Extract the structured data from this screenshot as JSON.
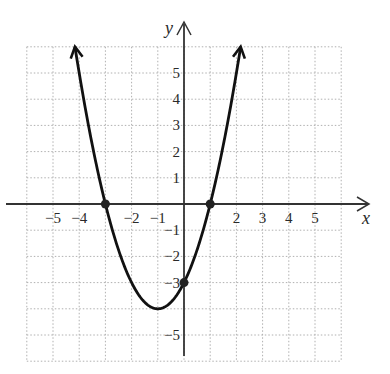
{
  "chart_data": {
    "type": "line",
    "title": "",
    "function": "y = x^2 + 2x - 3",
    "xlabel": "x",
    "ylabel": "y",
    "xlim": [
      -6,
      6
    ],
    "ylim": [
      -6,
      6
    ],
    "grid": true,
    "grid_style": "dotted",
    "x_tick_labels": [
      {
        "value": -5,
        "label": "−5"
      },
      {
        "value": -4,
        "label": "−4"
      },
      {
        "value": -2,
        "label": "−2"
      },
      {
        "value": -1,
        "label": "−1"
      },
      {
        "value": 2,
        "label": "2"
      },
      {
        "value": 3,
        "label": "3"
      },
      {
        "value": 4,
        "label": "4"
      },
      {
        "value": 5,
        "label": "5"
      }
    ],
    "y_tick_labels": [
      {
        "value": 5,
        "label": "5"
      },
      {
        "value": 4,
        "label": "4"
      },
      {
        "value": 3,
        "label": "3"
      },
      {
        "value": 2,
        "label": "2"
      },
      {
        "value": 1,
        "label": "1"
      },
      {
        "value": -1,
        "label": "−1"
      },
      {
        "value": -2,
        "label": "−2"
      },
      {
        "value": -3,
        "label": "−3"
      },
      {
        "value": -5,
        "label": "−5"
      }
    ],
    "series": [
      {
        "name": "parabola",
        "x": [
          -4.16,
          -4,
          -3.5,
          -3,
          -2.5,
          -2,
          -1.5,
          -1,
          -0.5,
          0,
          0.5,
          1,
          1.5,
          2,
          2.16
        ],
        "y": [
          6,
          5,
          2.25,
          0,
          -1.75,
          -3,
          -3.75,
          -4,
          -3.75,
          -3,
          -1.75,
          0,
          2.25,
          5,
          6
        ],
        "arrows_at_ends": true
      }
    ],
    "marked_points": [
      {
        "x": -3,
        "y": 0,
        "note": "x-intercept"
      },
      {
        "x": 1,
        "y": 0,
        "note": "x-intercept"
      },
      {
        "x": 0,
        "y": -3,
        "note": "y-intercept"
      }
    ],
    "vertex": {
      "x": -1,
      "y": -4
    }
  },
  "style": {
    "curve_color": "#111111",
    "axis_color": "#333333",
    "grid_color": "#b0b0b0",
    "point_color": "#222222"
  }
}
